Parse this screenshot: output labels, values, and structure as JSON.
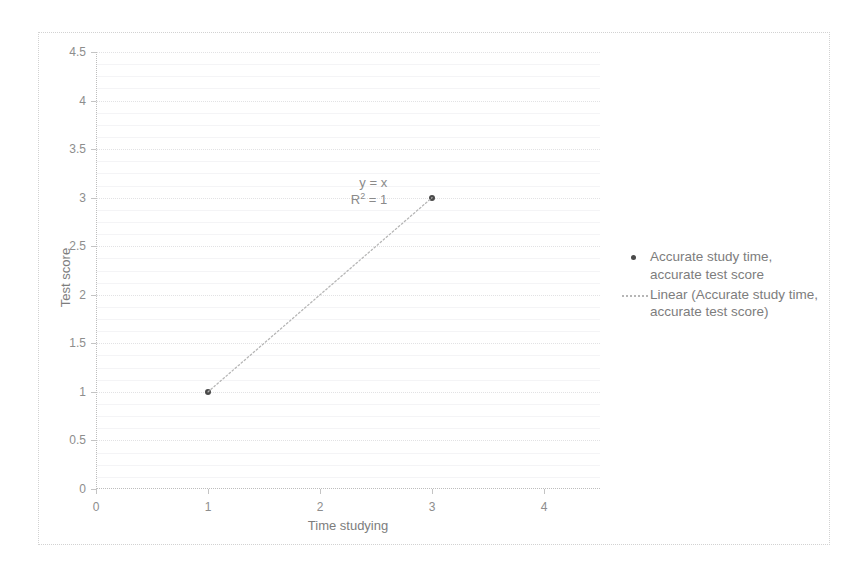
{
  "chart_data": {
    "type": "scatter",
    "title": "",
    "xlabel": "Time studying",
    "ylabel": "Test score",
    "xlim": [
      0,
      4.5
    ],
    "ylim": [
      0,
      4.5
    ],
    "xticks": [
      "0",
      "1",
      "2",
      "3",
      "4"
    ],
    "xtick_values": [
      0,
      1,
      2,
      3,
      4
    ],
    "yticks": [
      "0",
      "0.5",
      "1",
      "1.5",
      "2",
      "2.5",
      "3",
      "3.5",
      "4",
      "4.5"
    ],
    "ytick_values": [
      0,
      0.5,
      1,
      1.5,
      2,
      2.5,
      3,
      3.5,
      4,
      4.5
    ],
    "grid": true,
    "legend_position": "right",
    "series": [
      {
        "name": "Accurate study time, accurate test score",
        "type": "scatter",
        "marker": "circle",
        "color": "#4a4a4a",
        "x": [
          1,
          3
        ],
        "y": [
          1,
          3
        ],
        "points": [
          {
            "x": 1,
            "y": 1
          },
          {
            "x": 3,
            "y": 3
          }
        ]
      },
      {
        "name": "Linear (Accurate study time, accurate test score)",
        "type": "trendline",
        "style": "dotted",
        "color": "#b6b6b6",
        "x": [
          1,
          3
        ],
        "y": [
          1,
          3
        ]
      }
    ],
    "annotations": [
      {
        "text_line1": "y = x",
        "text_line2_prefix": "R",
        "text_line2_sup": "2",
        "text_line2_suffix": " = 1",
        "x": 2.6,
        "y": 3.15
      }
    ],
    "equation": "y = x",
    "r_squared": "R² = 1"
  },
  "annotation": {
    "line1": "y = x",
    "r_prefix": "R",
    "r_exponent": "2",
    "r_suffix": " = 1"
  },
  "legend": {
    "entries": [
      {
        "label": "Accurate study time, accurate test score",
        "marker": "scatter-dot"
      },
      {
        "label": "Linear (Accurate study time, accurate test score)",
        "marker": "dotted-line"
      }
    ]
  },
  "axes": {
    "x_title": "Time studying",
    "y_title": "Test score"
  },
  "colors": {
    "marker": "#4a4a4a",
    "trendline": "#b6b6b6",
    "gridline": "#e2e2e4",
    "minor_gridline": "#f4f4f6",
    "axis": "#bdbdbd",
    "text": "#7d7d7d",
    "frame": "#d2d2d2"
  }
}
